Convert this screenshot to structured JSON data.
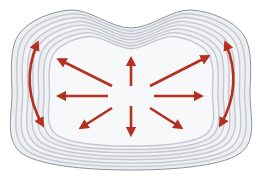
{
  "diagram": {
    "colors": {
      "background": "#ffffff",
      "outer_edge": "#8e929a",
      "ring_dark": "#c4c8d0",
      "ring_light": "#eceef2",
      "center_fill": "#f7f8fa",
      "arrow": "#b5301f"
    },
    "ring_count": 7,
    "center": {
      "x": 131,
      "y": 94
    },
    "radial_arrows": [
      {
        "name": "up",
        "from": [
          131,
          86
        ],
        "to": [
          131,
          60
        ]
      },
      {
        "name": "down",
        "from": [
          131,
          106
        ],
        "to": [
          131,
          133
        ]
      },
      {
        "name": "left",
        "from": [
          108,
          96
        ],
        "to": [
          60,
          96
        ]
      },
      {
        "name": "right",
        "from": [
          154,
          96
        ],
        "to": [
          200,
          96
        ]
      },
      {
        "name": "up-left",
        "from": [
          112,
          86
        ],
        "to": [
          60,
          60
        ]
      },
      {
        "name": "up-right",
        "from": [
          150,
          86
        ],
        "to": [
          207,
          57
        ]
      },
      {
        "name": "down-left",
        "from": [
          112,
          108
        ],
        "to": [
          82,
          127
        ]
      },
      {
        "name": "down-right",
        "from": [
          150,
          108
        ],
        "to": [
          180,
          127
        ]
      }
    ],
    "curved_arrows": [
      {
        "name": "left-double-arrow",
        "path": "M37 44 Q20 85 42 124"
      },
      {
        "name": "right-double-arrow",
        "path": "M226 44 Q243 85 221 124"
      }
    ]
  }
}
